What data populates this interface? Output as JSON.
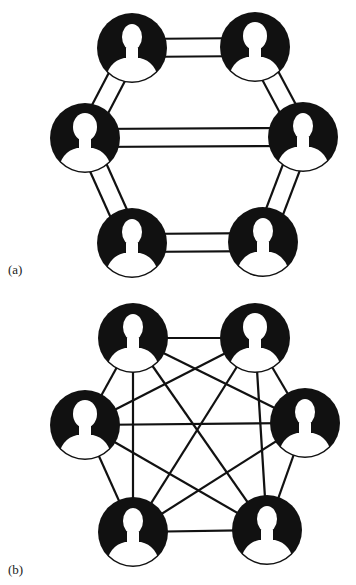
{
  "panels": [
    {
      "id": "a",
      "label": "(a)",
      "structure": "ring network with double-line links",
      "nodes": [
        {
          "id": "tl",
          "x": 132,
          "y": 48,
          "silhouette": "male"
        },
        {
          "id": "tr",
          "x": 255,
          "y": 47,
          "silhouette": "female"
        },
        {
          "id": "ml",
          "x": 85,
          "y": 138,
          "silhouette": "female-short-hair"
        },
        {
          "id": "mr",
          "x": 303,
          "y": 137,
          "silhouette": "male-curly"
        },
        {
          "id": "bl",
          "x": 132,
          "y": 243,
          "silhouette": "male"
        },
        {
          "id": "br",
          "x": 263,
          "y": 242,
          "silhouette": "male"
        }
      ],
      "edges": [
        [
          "tl",
          "tr"
        ],
        [
          "tl",
          "ml"
        ],
        [
          "tr",
          "mr"
        ],
        [
          "ml",
          "mr"
        ],
        [
          "ml",
          "bl"
        ],
        [
          "mr",
          "br"
        ],
        [
          "bl",
          "br"
        ]
      ]
    },
    {
      "id": "b",
      "label": "(b)",
      "structure": "fully connected network",
      "nodes": [
        {
          "id": "tl",
          "x": 133,
          "y": 338,
          "silhouette": "male"
        },
        {
          "id": "tr",
          "x": 255,
          "y": 338,
          "silhouette": "female"
        },
        {
          "id": "ml",
          "x": 85,
          "y": 425,
          "silhouette": "female-short-hair"
        },
        {
          "id": "mr",
          "x": 305,
          "y": 423,
          "silhouette": "male-curly"
        },
        {
          "id": "bl",
          "x": 133,
          "y": 532,
          "silhouette": "male"
        },
        {
          "id": "br",
          "x": 267,
          "y": 530,
          "silhouette": "male"
        }
      ],
      "edges": [
        [
          "tl",
          "tr"
        ],
        [
          "tl",
          "ml"
        ],
        [
          "tl",
          "mr"
        ],
        [
          "tl",
          "bl"
        ],
        [
          "tl",
          "br"
        ],
        [
          "tr",
          "ml"
        ],
        [
          "tr",
          "mr"
        ],
        [
          "tr",
          "bl"
        ],
        [
          "tr",
          "br"
        ],
        [
          "ml",
          "mr"
        ],
        [
          "ml",
          "bl"
        ],
        [
          "ml",
          "br"
        ],
        [
          "mr",
          "bl"
        ],
        [
          "mr",
          "br"
        ],
        [
          "bl",
          "br"
        ]
      ]
    }
  ],
  "style": {
    "node_radius": 35,
    "ink": "#111111",
    "background": "#ffffff"
  }
}
